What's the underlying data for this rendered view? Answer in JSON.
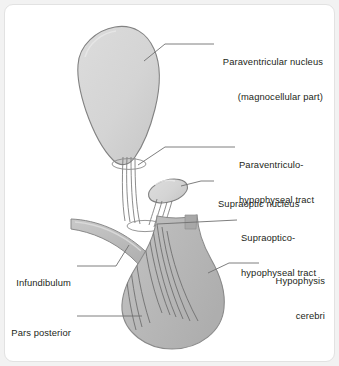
{
  "figure": {
    "background_color": "#f2f2f2",
    "panel_color": "#ffffff",
    "panel_border_color": "#e2e2e2",
    "ink_color": "#231f20",
    "outline_color": "#6f6f6f",
    "fill_light": "#d5d5d5",
    "fill_medium": "#b8b8b8",
    "fiber_color": "#6b6b6b",
    "leader_color": "#6f6f6f"
  },
  "labels": {
    "paraventricular_nucleus": {
      "line1": "Paraventricular nucleus",
      "line2": "(magnocellular part)"
    },
    "paraventriculo_hypophyseal_tract": {
      "line1": "Paraventriculo-",
      "line2": "hypophyseal tract"
    },
    "supraoptic_nucleus": {
      "line1": "Supraoptic nucleus"
    },
    "supraoptico_hypophyseal_tract": {
      "line1": "Supraoptico-",
      "line2": "hypophyseal tract"
    },
    "hypophysis_cerebri": {
      "line1": "Hypophysis",
      "line2": "cerebri"
    },
    "infundibulum": {
      "line1": "Infundibulum"
    },
    "pars_posterior": {
      "line1": "Pars posterior"
    }
  },
  "structures": {
    "paraventricular_nucleus": "paraventricular-nucleus-shape",
    "supraoptic_nucleus": "supraoptic-nucleus-shape",
    "hypophysis": "hypophysis-shape",
    "infundibulum": "infundibulum-shape",
    "pars_posterior_fibers": "pars-posterior-fiber-bundle",
    "tract_ring_upper": "paraventricular-tract-ring",
    "tract_ring_lower": "supraoptic-tract-ring",
    "neck_marker": "hypophysis-neck-marker"
  }
}
